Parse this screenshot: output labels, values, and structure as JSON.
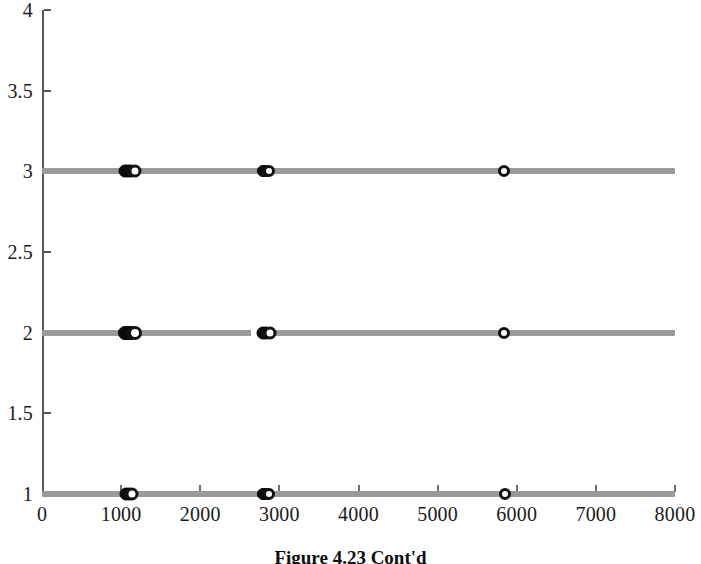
{
  "figure": {
    "caption": "Figure 4.23   Cont'd"
  },
  "chart_data": {
    "type": "scatter",
    "title": "",
    "xlabel": "",
    "ylabel": "",
    "xlim": [
      0,
      8000
    ],
    "ylim": [
      1,
      4
    ],
    "grid": false,
    "legend": "none",
    "xticks": [
      0,
      1000,
      2000,
      3000,
      4000,
      5000,
      6000,
      7000,
      8000
    ],
    "xticklabels": [
      "0",
      "1000",
      "2000",
      "3000",
      "4000",
      "5000",
      "6000",
      "7000",
      "8000"
    ],
    "yticks": [
      1,
      1.5,
      2,
      2.5,
      3,
      3.5,
      4
    ],
    "yticklabels": [
      "1",
      "1.5",
      "2",
      "2.5",
      "3",
      "3.5",
      "4"
    ],
    "line_color": "#9a9a9a",
    "marker_color": "#111111",
    "series": [
      {
        "name": "level-3",
        "y": 3,
        "line_span": [
          0,
          8000
        ],
        "gaps": [],
        "markers": [
          {
            "x": 1050,
            "style": "filled",
            "size": 13
          },
          {
            "x": 1090,
            "style": "filled",
            "size": 13
          },
          {
            "x": 1130,
            "style": "filled",
            "size": 13
          },
          {
            "x": 1170,
            "style": "open",
            "size": 13
          },
          {
            "x": 2790,
            "style": "filled",
            "size": 12
          },
          {
            "x": 2830,
            "style": "filled",
            "size": 12
          },
          {
            "x": 2870,
            "style": "open",
            "size": 12
          },
          {
            "x": 5840,
            "style": "open",
            "size": 12
          }
        ]
      },
      {
        "name": "level-2",
        "y": 2,
        "line_span": [
          0,
          8000
        ],
        "gaps": [
          [
            2640,
            2720
          ]
        ],
        "markers": [
          {
            "x": 1050,
            "style": "filled",
            "size": 14
          },
          {
            "x": 1090,
            "style": "filled",
            "size": 14
          },
          {
            "x": 1130,
            "style": "filled",
            "size": 14
          },
          {
            "x": 1180,
            "style": "open",
            "size": 14
          },
          {
            "x": 2790,
            "style": "filled",
            "size": 13
          },
          {
            "x": 2830,
            "style": "filled",
            "size": 13
          },
          {
            "x": 2880,
            "style": "open",
            "size": 13
          },
          {
            "x": 5840,
            "style": "open",
            "size": 12
          }
        ]
      },
      {
        "name": "level-1",
        "y": 1,
        "line_span": [
          0,
          8000
        ],
        "gaps": [],
        "markers": [
          {
            "x": 1060,
            "style": "filled",
            "size": 13
          },
          {
            "x": 1100,
            "style": "filled",
            "size": 13
          },
          {
            "x": 1140,
            "style": "open",
            "size": 13
          },
          {
            "x": 2790,
            "style": "filled",
            "size": 12
          },
          {
            "x": 2830,
            "style": "filled",
            "size": 12
          },
          {
            "x": 2870,
            "style": "open",
            "size": 12
          },
          {
            "x": 5850,
            "style": "open",
            "size": 12
          }
        ]
      }
    ]
  }
}
